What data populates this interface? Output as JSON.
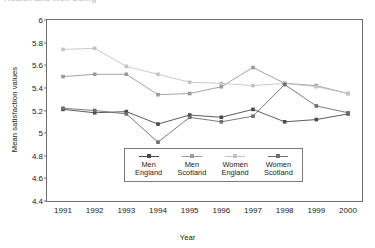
{
  "page": {
    "cut_off_top_text": "Health and well-being"
  },
  "chart_data": {
    "type": "line",
    "title": "",
    "xlabel": "Year",
    "ylabel": "Mean satisfaction values",
    "categories": [
      "1991",
      "1992",
      "1993",
      "1994",
      "1995",
      "1996",
      "1997",
      "1998",
      "1999",
      "2000"
    ],
    "x": [
      1991,
      1992,
      1993,
      1994,
      1995,
      1996,
      1997,
      1998,
      1999,
      2000
    ],
    "ylim": [
      4.4,
      6.0
    ],
    "yticks": [
      "4.4",
      "4.6",
      "4.8",
      "5",
      "5.2",
      "5.4",
      "5.6",
      "5.8",
      "6"
    ],
    "ytick_values": [
      4.4,
      4.6,
      4.8,
      5.0,
      5.2,
      5.4,
      5.6,
      5.8,
      6.0
    ],
    "grid": false,
    "legend_position": "inside-bottom-center",
    "marker": "square",
    "series": [
      {
        "name": "Men England",
        "label": "Men\nEngland",
        "color": "#4a4a4a",
        "values": [
          5.21,
          5.18,
          5.19,
          5.08,
          5.16,
          5.14,
          5.21,
          5.1,
          5.12,
          5.17
        ]
      },
      {
        "name": "Men Scotland",
        "label": "Men\nScotland",
        "color": "#9a9a9a",
        "values": [
          5.5,
          5.52,
          5.52,
          5.34,
          5.35,
          5.41,
          5.58,
          5.44,
          5.42,
          5.35
        ]
      },
      {
        "name": "Women England",
        "label": "Women\nEngland",
        "color": "#c4c4c4",
        "values": [
          5.74,
          5.75,
          5.59,
          5.52,
          5.45,
          5.44,
          5.42,
          5.44,
          5.41,
          5.35
        ]
      },
      {
        "name": "Women Scotland",
        "label": "Women\nScotland",
        "color": "#6e6e6e",
        "values": [
          5.22,
          5.2,
          5.17,
          4.92,
          5.14,
          5.1,
          5.15,
          5.43,
          5.24,
          5.18
        ]
      }
    ]
  }
}
